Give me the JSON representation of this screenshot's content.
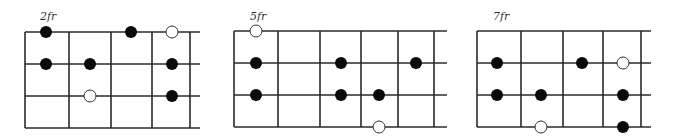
{
  "diagrams": [
    {
      "fret_label": "2fr",
      "label_x": 40,
      "left": 25,
      "right_extent": 200,
      "fret_lines": [
        25,
        69,
        111,
        152,
        190
      ],
      "strings_y": [
        32,
        64,
        96,
        128
      ],
      "dots": [
        {
          "x": 46,
          "string": 0,
          "fill": "filled"
        },
        {
          "x": 131,
          "string": 0,
          "fill": "filled"
        },
        {
          "x": 172,
          "string": 0,
          "fill": "open"
        },
        {
          "x": 46,
          "string": 1,
          "fill": "filled"
        },
        {
          "x": 90,
          "string": 1,
          "fill": "filled"
        },
        {
          "x": 172,
          "string": 1,
          "fill": "filled"
        },
        {
          "x": 90,
          "string": 2,
          "fill": "open"
        },
        {
          "x": 172,
          "string": 2,
          "fill": "filled"
        }
      ]
    },
    {
      "fret_label": "5fr",
      "label_x": 250,
      "left": 234,
      "right_extent": 447,
      "fret_lines": [
        234,
        278,
        320,
        361,
        398,
        434
      ],
      "strings_y": [
        31,
        63,
        95,
        127
      ],
      "dots": [
        {
          "x": 256,
          "string": 0,
          "fill": "open"
        },
        {
          "x": 256,
          "string": 1,
          "fill": "filled"
        },
        {
          "x": 341,
          "string": 1,
          "fill": "filled"
        },
        {
          "x": 416,
          "string": 1,
          "fill": "filled"
        },
        {
          "x": 256,
          "string": 2,
          "fill": "filled"
        },
        {
          "x": 341,
          "string": 2,
          "fill": "filled"
        },
        {
          "x": 379,
          "string": 2,
          "fill": "filled"
        },
        {
          "x": 379,
          "string": 3,
          "fill": "open"
        }
      ]
    },
    {
      "fret_label": "7fr",
      "label_x": 493,
      "left": 477,
      "right_extent": 651,
      "fret_lines": [
        477,
        521,
        563,
        603,
        641
      ],
      "strings_y": [
        31,
        63,
        95,
        127
      ],
      "dots": [
        {
          "x": 497,
          "string": 1,
          "fill": "filled"
        },
        {
          "x": 582,
          "string": 1,
          "fill": "filled"
        },
        {
          "x": 623,
          "string": 1,
          "fill": "open"
        },
        {
          "x": 497,
          "string": 2,
          "fill": "filled"
        },
        {
          "x": 541,
          "string": 2,
          "fill": "filled"
        },
        {
          "x": 623,
          "string": 2,
          "fill": "filled"
        },
        {
          "x": 541,
          "string": 3,
          "fill": "open"
        },
        {
          "x": 623,
          "string": 3,
          "fill": "filled"
        }
      ]
    }
  ],
  "style": {
    "line_color": "#2a2a2a",
    "dot_fill": "#0a0a0a",
    "open_fill": "#ffffff",
    "dot_radius": 6
  }
}
